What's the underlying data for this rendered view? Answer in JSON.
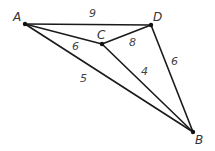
{
  "graph": {
    "vertices": [
      {
        "id": "A",
        "label": "A",
        "x": 25,
        "y": 24,
        "lx": 13,
        "ly": 21
      },
      {
        "id": "D",
        "label": "D",
        "x": 151,
        "y": 25,
        "lx": 153,
        "ly": 21
      },
      {
        "id": "C",
        "label": "C",
        "x": 102,
        "y": 44,
        "lx": 97,
        "ly": 39
      },
      {
        "id": "B",
        "label": "B",
        "x": 193,
        "y": 132,
        "lx": 195,
        "ly": 144
      }
    ],
    "edges": [
      {
        "from": "A",
        "to": "D",
        "weight": "9",
        "wx": 89,
        "wy": 17
      },
      {
        "from": "A",
        "to": "C",
        "weight": "6",
        "wx": 72,
        "wy": 50
      },
      {
        "from": "C",
        "to": "D",
        "weight": "8",
        "wx": 129,
        "wy": 46
      },
      {
        "from": "C",
        "to": "B",
        "weight": "4",
        "wx": 141,
        "wy": 75
      },
      {
        "from": "D",
        "to": "B",
        "weight": "6",
        "wx": 171,
        "wy": 65
      },
      {
        "from": "A",
        "to": "B",
        "weight": "5",
        "wx": 80,
        "wy": 82
      }
    ]
  }
}
